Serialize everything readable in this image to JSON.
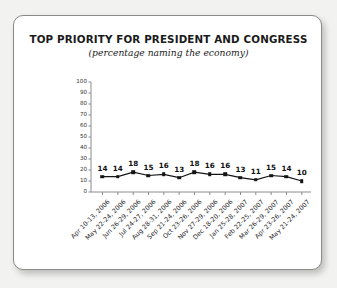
{
  "chart_data": {
    "type": "line",
    "title": "TOP PRIORITY FOR PRESIDENT AND CONGRESS",
    "subtitle": "(percentage naming the economy)",
    "xlabel": "",
    "ylabel": "",
    "ylim": [
      0,
      100
    ],
    "yticks": [
      0,
      10,
      20,
      30,
      40,
      50,
      60,
      70,
      80,
      90,
      100
    ],
    "ytick_labels": [
      "0",
      "10",
      "20",
      "30",
      "40",
      "50",
      "60",
      "70",
      "80",
      "90",
      "100"
    ],
    "grid": false,
    "legend": "none",
    "marker": "square",
    "series_color": "#141414",
    "categories": [
      "Apr 10-13, 2006",
      "May 22-24, 2006",
      "Jun 26-29, 2006",
      "Jul 24-27, 2006",
      "Aug 28-31, 2006",
      "Sep 21-24, 2006",
      "Oct 23-26, 2006",
      "Nov 27-29, 2006",
      "Dec 18-20, 2006",
      "Jan 25-28, 2007",
      "Feb 22-25, 2007",
      "Mar 26-29, 2007",
      "Apr 23-26, 2007",
      "May 21-24, 2007"
    ],
    "values": [
      14,
      14,
      18,
      15,
      16,
      13,
      18,
      16,
      16,
      13,
      11,
      15,
      14,
      10
    ],
    "data_labels": [
      "14",
      "14",
      "18",
      "15",
      "16",
      "13",
      "18",
      "16",
      "16",
      "13",
      "11",
      "15",
      "14",
      "10"
    ]
  },
  "card": {
    "background": "#ffffff",
    "border_color": "#8a8a8a"
  },
  "page": {
    "background": "#f2f2f0"
  }
}
